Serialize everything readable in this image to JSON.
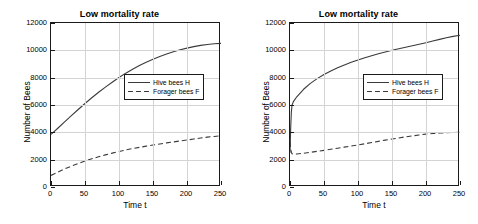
{
  "figure": {
    "panel_count": 2,
    "background": "#ffffff",
    "line_color": "#3a3a3a",
    "grid_color": "#d4d4d4",
    "axis_color": "#1a1a1a"
  },
  "axes": {
    "xlabel": "Time t",
    "ylabel": "Number of Bees",
    "xticks": [
      "0",
      "50",
      "100",
      "150",
      "200",
      "250"
    ],
    "yticks": [
      "0",
      "2000",
      "4000",
      "6000",
      "8000",
      "10000",
      "12000"
    ],
    "xlim": [
      0,
      250
    ],
    "ylim": [
      0,
      12000
    ]
  },
  "legend": {
    "hive_label": "Hive bees H",
    "forager_label": "Forager bees F"
  },
  "chart_data": [
    {
      "type": "line",
      "title": "Low mortality rate",
      "xlabel": "Time t",
      "ylabel": "Number of Bees",
      "xlim": [
        0,
        250
      ],
      "ylim": [
        0,
        12000
      ],
      "xticks": [
        0,
        50,
        100,
        150,
        200,
        250
      ],
      "yticks": [
        0,
        2000,
        4000,
        6000,
        8000,
        10000,
        12000
      ],
      "grid": true,
      "legend_position": "center-right",
      "x": [
        0,
        10,
        20,
        30,
        40,
        50,
        60,
        70,
        80,
        90,
        100,
        110,
        120,
        130,
        140,
        150,
        160,
        170,
        180,
        190,
        200,
        210,
        220,
        230,
        240,
        250
      ],
      "series": [
        {
          "name": "Hive bees H",
          "style": "solid",
          "values": [
            3850,
            4300,
            4760,
            5220,
            5670,
            6110,
            6530,
            6930,
            7310,
            7670,
            8010,
            8330,
            8620,
            8890,
            9130,
            9350,
            9550,
            9730,
            9900,
            10040,
            10160,
            10270,
            10360,
            10430,
            10480,
            10510
          ]
        },
        {
          "name": "Forager bees F",
          "style": "dashed",
          "values": [
            850,
            1090,
            1320,
            1530,
            1720,
            1900,
            2060,
            2210,
            2350,
            2480,
            2600,
            2710,
            2810,
            2900,
            2990,
            3070,
            3150,
            3230,
            3300,
            3370,
            3440,
            3510,
            3580,
            3650,
            3700,
            3750
          ]
        }
      ]
    },
    {
      "type": "line",
      "title": "Low mortality rate",
      "xlabel": "Time t",
      "ylabel": "Number of Bees",
      "xlim": [
        0,
        250
      ],
      "ylim": [
        0,
        12000
      ],
      "xticks": [
        0,
        50,
        100,
        150,
        200,
        250
      ],
      "yticks": [
        0,
        2000,
        4000,
        6000,
        8000,
        10000,
        12000
      ],
      "grid": true,
      "legend_position": "center-right",
      "x": [
        0,
        1,
        2,
        3,
        5,
        10,
        20,
        30,
        40,
        50,
        60,
        70,
        80,
        90,
        100,
        110,
        120,
        130,
        140,
        150,
        160,
        170,
        180,
        190,
        200,
        210,
        220,
        230,
        240,
        250
      ],
      "series": [
        {
          "name": "Hive bees H",
          "style": "solid",
          "values": [
            2500,
            4300,
            5500,
            6000,
            6250,
            6600,
            7150,
            7580,
            7930,
            8230,
            8490,
            8720,
            8930,
            9120,
            9300,
            9460,
            9610,
            9750,
            9880,
            10000,
            10110,
            10220,
            10330,
            10440,
            10560,
            10680,
            10800,
            10920,
            11020,
            11100
          ]
        },
        {
          "name": "Forager bees F",
          "style": "dashed",
          "values": [
            3300,
            2800,
            2550,
            2440,
            2400,
            2410,
            2470,
            2540,
            2610,
            2680,
            2760,
            2840,
            2920,
            3000,
            3080,
            3160,
            3250,
            3340,
            3430,
            3510,
            3590,
            3670,
            3740,
            3810,
            3870,
            3910,
            3950,
            3970,
            3990,
            4000
          ]
        }
      ]
    }
  ]
}
